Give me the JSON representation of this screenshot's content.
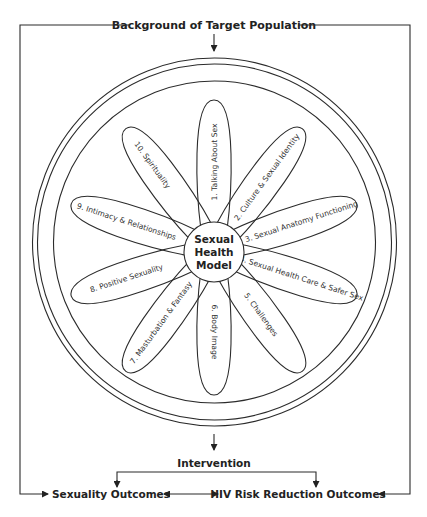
{
  "header": {
    "title": "Background of Target Population"
  },
  "model": {
    "hub_lines": [
      "Sexual",
      "Health",
      "Model"
    ],
    "components": [
      {
        "label": "1. Talking About Sex"
      },
      {
        "label": "2. Culture & Sexual Identity"
      },
      {
        "label": "3. Sexual Anatomy Functioning"
      },
      {
        "label": "4. Sexual Health Care & Safer Sex"
      },
      {
        "label": "5. Challenges"
      },
      {
        "label": "6. Body Image"
      },
      {
        "label": "7. Masturbation & Fantasy"
      },
      {
        "label": "8. Positive Sexuality"
      },
      {
        "label": "9. Intimacy & Relationships"
      },
      {
        "label": "10. Spirituality"
      }
    ]
  },
  "flow": {
    "intervention": "Intervention",
    "outcome_left": "Sexuality Outcomes",
    "outcome_right": "HIV Risk Reduction Outcomes"
  },
  "colors": {
    "line": "#2b2b2b",
    "text": "#222222",
    "background": "#ffffff"
  }
}
